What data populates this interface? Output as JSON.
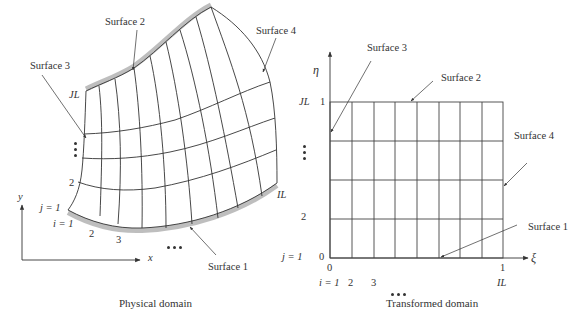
{
  "physical": {
    "caption": "Physical domain",
    "surfaces": {
      "s1": "Surface 1",
      "s2": "Surface 2",
      "s3": "Surface 3",
      "s4": "Surface 4"
    },
    "labels": {
      "JL": "JL",
      "IL": "IL",
      "j1": "j = 1",
      "j2": "2",
      "i1": "i = 1",
      "i2": "2",
      "i3": "3"
    },
    "axes": {
      "x": "x",
      "y": "y"
    }
  },
  "transformed": {
    "caption": "Transformed domain",
    "surfaces": {
      "s1": "Surface 1",
      "s2": "Surface 2",
      "s3": "Surface 3",
      "s4": "Surface 4"
    },
    "labels": {
      "JL": "JL",
      "eta1": "1",
      "j2": "2",
      "j1": "j = 1",
      "eta0": "0",
      "xi0": "0",
      "xi1": "1",
      "i1": "i = 1",
      "i2": "2",
      "i3": "3",
      "IL": "IL"
    },
    "axes": {
      "xi": "ξ",
      "eta": "η"
    },
    "grid": {
      "columns": 8,
      "rows": 4
    }
  },
  "colors": {
    "line": "#333333",
    "shade": "#9a9a9a"
  }
}
